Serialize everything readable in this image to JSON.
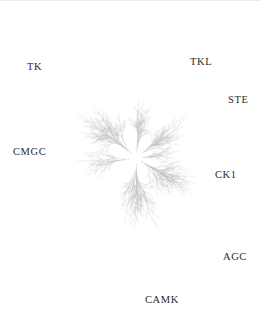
{
  "figure": {
    "name": "kinome-tree",
    "type": "radial-phylogenetic-tree",
    "width": 261,
    "height": 330,
    "background_color": "#ffffff",
    "branch_color": "#b9b9b9",
    "label_color": "#2b2b2b"
  },
  "tree": {
    "center_x": 136,
    "center_y": 158,
    "description": "Radial dendrogram of the human protein kinase superfamily with seven labelled kinase groups radiating from a central hub.",
    "groups": [
      {
        "id": "tk",
        "label": "TK",
        "label_x": 27,
        "label_y": 62,
        "angle_deg": 139,
        "spread_deg": 46,
        "trunk_length": 58,
        "fan_length": 62,
        "density": 1.0,
        "tone": 0.78
      },
      {
        "id": "tkl",
        "label": "TKL",
        "label_x": 190,
        "label_y": 57,
        "angle_deg": 84,
        "spread_deg": 30,
        "trunk_length": 52,
        "fan_length": 52,
        "density": 0.72,
        "tone": 0.55
      },
      {
        "id": "ste",
        "label": "STE",
        "label_x": 228,
        "label_y": 95,
        "angle_deg": 38,
        "spread_deg": 34,
        "trunk_length": 50,
        "fan_length": 54,
        "density": 0.8,
        "tone": 0.6
      },
      {
        "id": "ck1",
        "label": "CK1",
        "label_x": 215,
        "label_y": 170,
        "angle_deg": 5,
        "spread_deg": 20,
        "trunk_length": 40,
        "fan_length": 34,
        "density": 0.42,
        "tone": 0.42
      },
      {
        "id": "agc",
        "label": "AGC",
        "label_x": 223,
        "label_y": 252,
        "angle_deg": -32,
        "spread_deg": 34,
        "trunk_length": 52,
        "fan_length": 58,
        "density": 0.86,
        "tone": 0.72
      },
      {
        "id": "camk",
        "label": "CAMK",
        "label_x": 145,
        "label_y": 295,
        "angle_deg": -88,
        "spread_deg": 50,
        "trunk_length": 56,
        "fan_length": 62,
        "density": 0.95,
        "tone": 0.7
      },
      {
        "id": "cmgc",
        "label": "CMGC",
        "label_x": 13,
        "label_y": 147,
        "angle_deg": 188,
        "spread_deg": 42,
        "trunk_length": 54,
        "fan_length": 50,
        "density": 0.62,
        "tone": 0.32
      }
    ]
  }
}
